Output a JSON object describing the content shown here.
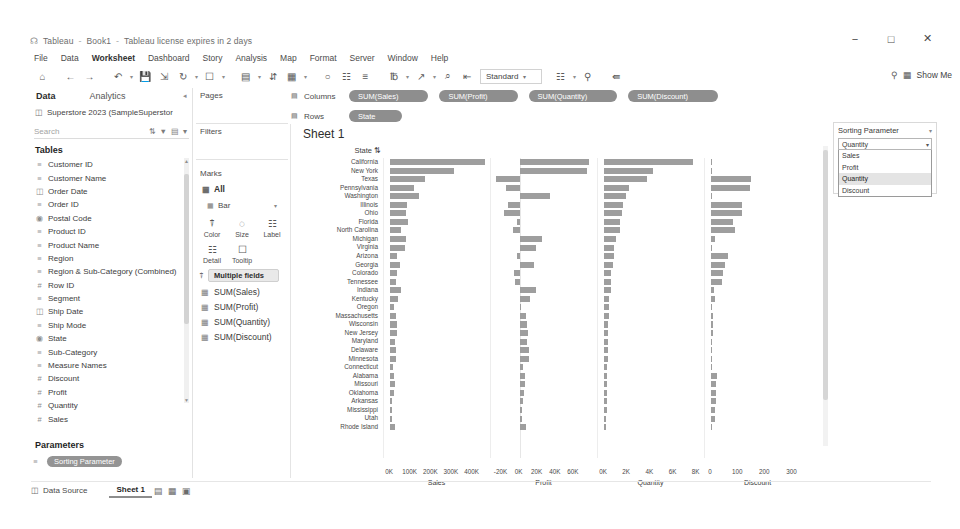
{
  "window": {
    "app_name": "Tableau",
    "document_name": "Book1",
    "license_notice": "Tableau license expires in 2 days",
    "minimize": "−",
    "maximize": "□",
    "close": "✕"
  },
  "menubar": {
    "items": [
      "File",
      "Data",
      "Worksheet",
      "Dashboard",
      "Story",
      "Analysis",
      "Map",
      "Format",
      "Server",
      "Window",
      "Help"
    ]
  },
  "toolbar": {
    "view_mode": "Standard",
    "show_me": "Show Me",
    "icons": [
      "home-icon",
      "back-icon",
      "forward-icon",
      "undo-icon",
      "redo-icon",
      "save-icon",
      "new-data-source-icon",
      "pause-refresh-icon",
      "refresh-icon",
      "clear-sheet-icon",
      "new-worksheet-icon",
      "duplicate-sheet-icon",
      "swap-rows-columns-icon",
      "sort-ascending-icon",
      "sort-descending-icon",
      "highlight-icon",
      "group-members-icon",
      "show-mark-labels-icon",
      "presentation-mode-icon",
      "fit-selector-icon",
      "show-hide-cards-icon",
      "share-icon",
      "zoom-icon"
    ]
  },
  "data_pane": {
    "tab_data": "Data",
    "tab_analytics": "Analytics",
    "collapse_icon": "chevron-left-icon",
    "datasource": "Superstore 2023 (SampleSuperstor",
    "datasource_icon": "data-source-icon",
    "search_placeholder": "Search",
    "search_icons": [
      "sort-az-icon",
      "filter-icon",
      "grid-view-icon"
    ],
    "tables_title": "Tables",
    "fields": [
      {
        "name": "Customer ID",
        "icon": "abc-dimension-icon",
        "type": "dimension"
      },
      {
        "name": "Customer Name",
        "icon": "abc-dimension-icon",
        "type": "dimension"
      },
      {
        "name": "Order Date",
        "icon": "calendar-icon",
        "type": "date"
      },
      {
        "name": "Order ID",
        "icon": "abc-dimension-icon",
        "type": "dimension"
      },
      {
        "name": "Postal Code",
        "icon": "globe-geo-icon",
        "type": "geo"
      },
      {
        "name": "Product ID",
        "icon": "abc-dimension-icon",
        "type": "dimension"
      },
      {
        "name": "Product Name",
        "icon": "abc-dimension-icon",
        "type": "dimension"
      },
      {
        "name": "Region",
        "icon": "abc-dimension-icon",
        "type": "dimension"
      },
      {
        "name": "Region & Sub-Category (Combined)",
        "icon": "abc-dimension-icon",
        "type": "dimension"
      },
      {
        "name": "Row ID",
        "icon": "number-icon",
        "type": "measure"
      },
      {
        "name": "Segment",
        "icon": "abc-dimension-icon",
        "type": "dimension"
      },
      {
        "name": "Ship Date",
        "icon": "calendar-icon",
        "type": "date"
      },
      {
        "name": "Ship Mode",
        "icon": "abc-dimension-icon",
        "type": "dimension"
      },
      {
        "name": "State",
        "icon": "globe-geo-icon",
        "type": "geo"
      },
      {
        "name": "Sub-Category",
        "icon": "abc-dimension-icon",
        "type": "dimension"
      },
      {
        "name": "Measure Names",
        "icon": "abc-dimension-icon",
        "type": "dimension"
      },
      {
        "name": "Discount",
        "icon": "number-icon",
        "type": "measure"
      },
      {
        "name": "Profit",
        "icon": "number-icon",
        "type": "measure"
      },
      {
        "name": "Quantity",
        "icon": "number-icon",
        "type": "measure"
      },
      {
        "name": "Sales",
        "icon": "number-icon",
        "type": "measure"
      }
    ],
    "parameters_title": "Parameters",
    "parameter_name": "Sorting Parameter",
    "parameter_icon": "abc-dimension-icon"
  },
  "cards": {
    "pages_label": "Pages",
    "filters_label": "Filters",
    "marks_label": "Marks",
    "marks_all": "All",
    "marks_all_icon": "marks-card-icon",
    "mark_type": "Bar",
    "mark_type_icon": "bar-mark-icon",
    "buttons": [
      {
        "label": "Color",
        "icon": "color-icon"
      },
      {
        "label": "Size",
        "icon": "size-icon"
      },
      {
        "label": "Label",
        "icon": "label-icon"
      },
      {
        "label": "Detail",
        "icon": "detail-icon"
      },
      {
        "label": "Tooltip",
        "icon": "tooltip-icon"
      }
    ],
    "color_field": "Multiple fields",
    "color_field_icon": "color-icon",
    "measure_cards": [
      "SUM(Sales)",
      "SUM(Profit)",
      "SUM(Quantity)",
      "SUM(Discount)"
    ]
  },
  "shelves": {
    "columns_label": "Columns",
    "columns_icon": "columns-shelf-icon",
    "rows_label": "Rows",
    "rows_icon": "rows-shelf-icon",
    "columns_pills": [
      "SUM(Sales)",
      "SUM(Profit)",
      "SUM(Quantity)",
      "SUM(Discount)"
    ],
    "rows_pills": [
      "State"
    ]
  },
  "worksheet": {
    "title": "Sheet 1",
    "row_header": "State",
    "row_header_sort_icon": "sort-indicator-icon"
  },
  "parameter_panel": {
    "title": "Sorting Parameter",
    "title_caret": "chevron-down-icon",
    "selected": "Quantity",
    "dropdown_icon": "chevron-down-icon",
    "options": [
      "Sales",
      "Profit",
      "Quantity",
      "Discount"
    ]
  },
  "statusbar": {
    "data_source_label": "Data Source",
    "data_source_icon": "data-source-tab-icon",
    "sheet_tab": "Sheet 1",
    "icons": [
      "new-worksheet-icon",
      "new-dashboard-icon",
      "new-story-icon"
    ]
  },
  "chart_data": {
    "type": "bar",
    "title": "Sheet 1",
    "orientation": "horizontal",
    "ylabel": "State",
    "sorted_by": "Quantity",
    "categories": [
      "California",
      "New York",
      "Texas",
      "Pennsylvania",
      "Washington",
      "Illinois",
      "Ohio",
      "Florida",
      "North Carolina",
      "Michigan",
      "Virginia",
      "Arizona",
      "Georgia",
      "Colorado",
      "Tennessee",
      "Indiana",
      "Kentucky",
      "Oregon",
      "Massachusetts",
      "Wisconsin",
      "New Jersey",
      "Maryland",
      "Delaware",
      "Minnesota",
      "Connecticut",
      "Alabama",
      "Missouri",
      "Oklahoma",
      "Arkansas",
      "Mississippi",
      "Utah",
      "Rhode Island"
    ],
    "panels": [
      {
        "name": "Sales",
        "axis_label": "Sales",
        "ticks": [
          "0K",
          "100K",
          "200K",
          "300K",
          "400K"
        ],
        "tick_values": [
          0,
          100000,
          200000,
          300000,
          400000
        ],
        "xlim": [
          0,
          460000
        ],
        "values": [
          457688,
          310876,
          170188,
          116512,
          138641,
          80166,
          78258,
          89474,
          55603,
          76270,
          70637,
          35282,
          49095,
          32108,
          30662,
          53555,
          36592,
          17431,
          28634,
          32115,
          35764,
          23706,
          27451,
          29863,
          13384,
          19511,
          22205,
          19683,
          11678,
          10771,
          11220,
          22628
        ]
      },
      {
        "name": "Profit",
        "axis_label": "Profit",
        "ticks": [
          "-20K",
          "0K",
          "20K",
          "40K",
          "60K"
        ],
        "tick_values": [
          -20000,
          0,
          20000,
          40000,
          60000
        ],
        "xlim": [
          -25000,
          80000
        ],
        "values": [
          76381,
          74039,
          -25729,
          -15559,
          33403,
          -12608,
          -16971,
          -3399,
          -7490,
          24463,
          18598,
          -3428,
          16250,
          -6527,
          -5342,
          18382,
          11200,
          1190,
          6785,
          8401,
          9773,
          7687,
          9978,
          10823,
          3511,
          5787,
          6436,
          4853,
          4009,
          3173,
          2547,
          7286
        ]
      },
      {
        "name": "Quantity",
        "axis_label": "Quantity",
        "ticks": [
          "0K",
          "2K",
          "4K",
          "6K",
          "8K"
        ],
        "tick_values": [
          0,
          2000,
          4000,
          6000,
          8000
        ],
        "xlim": [
          0,
          8200
        ],
        "values": [
          7667,
          4224,
          3724,
          2153,
          1883,
          1613,
          1544,
          1398,
          1361,
          1058,
          886,
          862,
          782,
          616,
          577,
          562,
          451,
          441,
          402,
          376,
          367,
          341,
          330,
          316,
          288,
          279,
          270,
          264,
          240,
          218,
          197,
          196
        ]
      },
      {
        "name": "Discount",
        "axis_label": "Discount",
        "ticks": [
          "0",
          "100",
          "200",
          "300"
        ],
        "tick_values": [
          0,
          100,
          200,
          300
        ],
        "xlim": [
          0,
          350
        ],
        "values": [
          0,
          0,
          148,
          142,
          0,
          116,
          115,
          81,
          87,
          14,
          0,
          63,
          53,
          45,
          42,
          11,
          13,
          0,
          8,
          6,
          6,
          0,
          0,
          0,
          5,
          21,
          19,
          20,
          18,
          16,
          14,
          0
        ]
      }
    ]
  }
}
